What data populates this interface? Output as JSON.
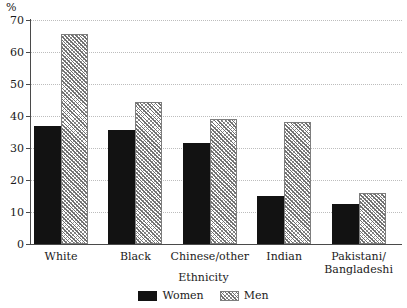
{
  "chart_data": {
    "type": "bar",
    "title": "",
    "subtitle": "",
    "xlabel": "Ethnicity",
    "ylabel": "%",
    "categories": [
      "White",
      "Black",
      "Chinese/other",
      "Indian",
      "Pakistani/\nBangladeshi"
    ],
    "series": [
      {
        "name": "Women",
        "values": [
          37,
          35.5,
          31.5,
          15,
          12.5
        ],
        "color": "#121212",
        "fill": "solid"
      },
      {
        "name": "Men",
        "values": [
          65.5,
          44.5,
          39,
          38,
          16
        ],
        "color": "#6f6f6f",
        "fill": "hatched"
      }
    ],
    "ylim": [
      0,
      70
    ],
    "y_ticks": [
      0,
      10,
      20,
      30,
      40,
      50,
      60,
      70
    ],
    "y_tick_labels": [
      "0",
      "10",
      "20",
      "30",
      "40",
      "50",
      "60",
      "70"
    ],
    "grid": true,
    "grid_axis": "y",
    "grid_style": "dotted",
    "legend_position": "bottom-center",
    "legend_entries": [
      "Women",
      "Men"
    ],
    "annotations": []
  },
  "axis": {
    "y_unit_label": "%",
    "x_title": "Ethnicity"
  },
  "legend": {
    "items": [
      {
        "label": "Women",
        "swatch": "solid-black-swatch"
      },
      {
        "label": "Men",
        "swatch": "hatched-swatch"
      }
    ]
  }
}
